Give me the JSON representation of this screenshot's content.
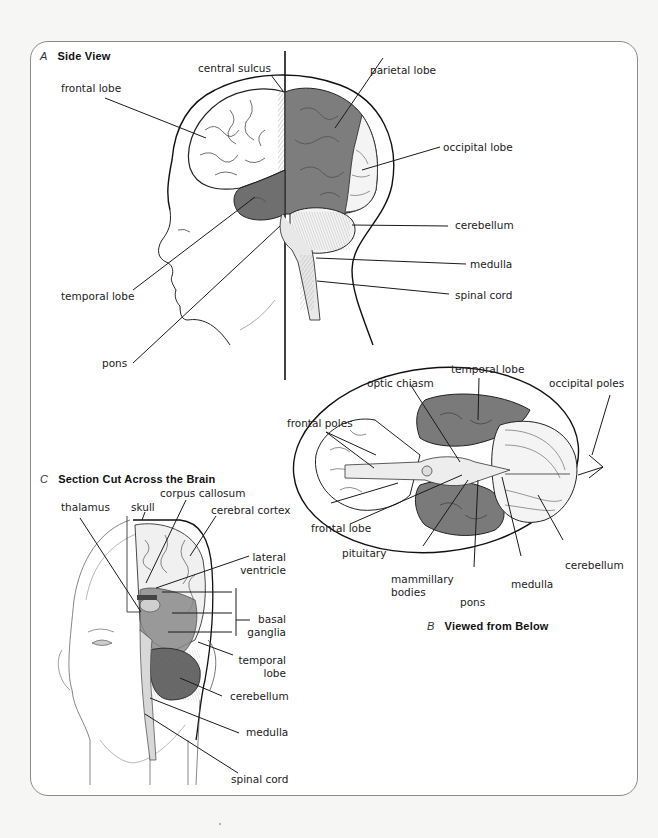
{
  "figure": {
    "colors": {
      "panel_border": "#8a8a8a",
      "line": "#1a1a1a",
      "shaded_region": "#7d7d7d",
      "dark_shade": "#6a6a6a",
      "background": "#ffffff"
    },
    "panel_a": {
      "letter": "A",
      "title": "Side View",
      "labels": {
        "central_sulcus": "central sulcus",
        "frontal_lobe": "frontal lobe",
        "parietal_lobe": "parietal lobe",
        "occipital_lobe": "occipital lobe",
        "cerebellum": "cerebellum",
        "medulla": "medulla",
        "spinal_cord": "spinal cord",
        "temporal_lobe": "temporal lobe",
        "pons": "pons"
      }
    },
    "panel_b": {
      "letter": "B",
      "title": "Viewed from Below",
      "labels": {
        "temporal_lobe": "temporal lobe",
        "optic_chiasm": "optic chiasm",
        "occipital_poles": "occipital poles",
        "frontal_poles": "frontal poles",
        "frontal_lobe": "frontal lobe",
        "pituitary": "pituitary",
        "mammillary_bodies_1": "mammillary",
        "mammillary_bodies_2": "bodies",
        "pons": "pons",
        "medulla": "medulla",
        "cerebellum": "cerebellum"
      }
    },
    "panel_c": {
      "letter": "C",
      "title": "Section Cut Across the Brain",
      "labels": {
        "thalamus": "thalamus",
        "skull": "skull",
        "corpus_callosum": "corpus callosum",
        "cerebral_cortex": "cerebral cortex",
        "lateral_ventricle_1": "lateral",
        "lateral_ventricle_2": "ventricle",
        "basal_ganglia_1": "basal",
        "basal_ganglia_2": "ganglia",
        "temporal_lobe_1": "temporal",
        "temporal_lobe_2": "lobe",
        "cerebellum": "cerebellum",
        "medulla": "medulla",
        "spinal_cord": "spinal cord"
      }
    }
  }
}
